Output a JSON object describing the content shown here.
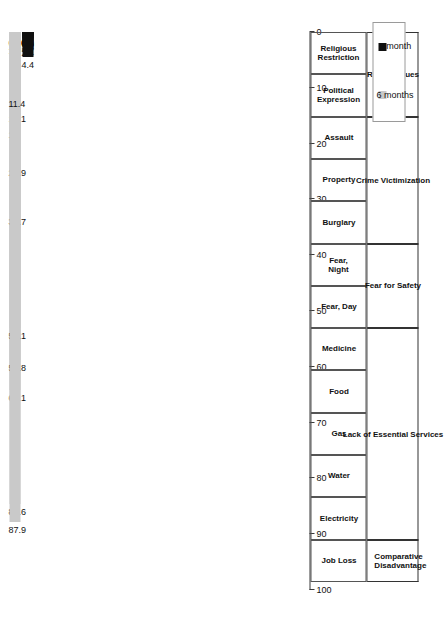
{
  "chart_data": {
    "type": "bar",
    "orientation": "horizontal-rotated",
    "title": "",
    "xlabel": "",
    "ylabel": "",
    "ylim": [
      0,
      100
    ],
    "grid": false,
    "legend_position": "bottom-right",
    "tick_labels": [
      "0",
      "10",
      "20",
      "30",
      "40",
      "50",
      "60",
      "70",
      "80",
      "90",
      "100"
    ],
    "categories": [
      "Religious\nRestriction",
      "Political\nExpression",
      "Assault",
      "Property",
      "Burglary",
      "Fear, Night",
      "Fear, Day",
      "Medicine",
      "Food",
      "Gas",
      "Water",
      "Electricity",
      "Job Loss"
    ],
    "groups": [
      {
        "label": "Rights Issues",
        "span": 2
      },
      {
        "label": "Crime Victimization",
        "span": 3
      },
      {
        "label": "Fear for Safety",
        "span": 2
      },
      {
        "label": "Lack of Essential Services",
        "span": 5
      },
      {
        "label": "Comparative\nDisadvantage",
        "span": 1
      }
    ],
    "series": [
      {
        "name": "6 months",
        "color": "#c9c9c9",
        "values": [
          14.1,
          64.1,
          0.5,
          1.3,
          1.9,
          84.6,
          58.8,
          23.9,
          17,
          32.7,
          53.1,
          87.9,
          11.4
        ]
      },
      {
        "name": "1 month",
        "color": "#101010",
        "values": [
          0.2,
          1.3,
          0.3,
          1.1,
          0.1,
          0.8,
          1.4,
          0.8,
          0.6,
          1.7,
          4.4,
          2.4,
          0.3
        ]
      }
    ],
    "value_labels_6m": [
      "14.1",
      "64.1",
      "0.5",
      "1.3",
      "1.9",
      "84.6",
      "58.8",
      "23.9",
      "17",
      "32.7",
      "53.1",
      "87.9",
      "11.4"
    ],
    "value_labels_1m": [
      "0.2",
      "1.3",
      "0.3",
      "1.1",
      "0.1",
      "0.8",
      "1.4",
      "0.8",
      "0.6",
      "1.7",
      "4.4",
      "2.4",
      "0.3"
    ]
  },
  "legend": {
    "items": [
      {
        "label": "1 month",
        "color": "#101010"
      },
      {
        "label": "6 months",
        "color": "#c9c9c9"
      }
    ]
  }
}
